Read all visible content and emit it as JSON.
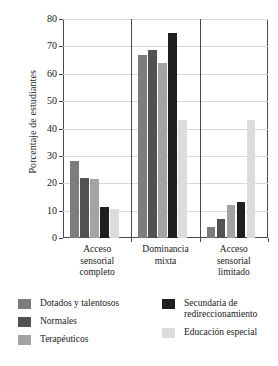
{
  "chart_data": {
    "type": "bar",
    "title": "",
    "subtitle": "",
    "xlabel": "",
    "ylabel": "Porcentaje de estudiantes",
    "ylim": [
      0,
      80
    ],
    "yticks": [
      0,
      10,
      20,
      30,
      40,
      50,
      60,
      70,
      80
    ],
    "grid": true,
    "legend_position": "bottom",
    "categories": [
      "Acceso sensorial completo",
      "Dominancia mixta",
      "Acceso sensorial limitado"
    ],
    "category_lines": [
      [
        "Acceso",
        "sensorial",
        "completo"
      ],
      [
        "Dominancia",
        "mixta"
      ],
      [
        "Acceso",
        "sensorial",
        "limitado"
      ]
    ],
    "series": [
      {
        "name": "Dotados y talentosos",
        "color": "#7d7d7d",
        "values": [
          28,
          67,
          4
        ]
      },
      {
        "name": "Normales",
        "color": "#525252",
        "values": [
          22,
          68.5,
          7
        ]
      },
      {
        "name": "Terapéuticos",
        "color": "#a3a3a3",
        "values": [
          21.5,
          64,
          12
        ]
      },
      {
        "name": "Secundaria de redireccionamiento",
        "color": "#1f1f1f",
        "values": [
          11.5,
          75,
          13
        ]
      },
      {
        "name": "Educación especial",
        "color": "#dcdcdc",
        "values": [
          10.5,
          43,
          43
        ]
      }
    ],
    "legend_left": [
      {
        "label": "Dotados y talentosos",
        "color": "#7d7d7d"
      },
      {
        "label": "Normales",
        "color": "#525252"
      },
      {
        "label": "Terapéuticos",
        "color": "#a3a3a3"
      }
    ],
    "legend_right": [
      {
        "label": "Secundaria de redireccionamiento",
        "color": "#1f1f1f"
      },
      {
        "label": "Educación especial",
        "color": "#dcdcdc"
      }
    ],
    "legend_right_lines": [
      [
        "Secundaria de",
        "redireccionamiento"
      ],
      [
        "Educación especial"
      ]
    ]
  },
  "colors": {
    "axis": "#4a4a4a",
    "grid": "#d9d9d9",
    "background": "#ffffff",
    "text": "#1a1a1a"
  }
}
